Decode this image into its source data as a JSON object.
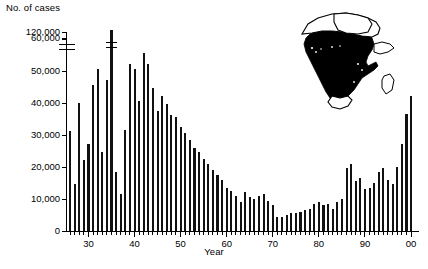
{
  "chart": {
    "ylabel": "No. of cases",
    "xlabel": "Year",
    "y_ticks": [
      "0",
      "10,000",
      "20,000",
      "30,000",
      "40,000",
      "50,000",
      "60,000",
      "120,000"
    ],
    "x_ticks": [
      "30",
      "40",
      "50",
      "60",
      "70",
      "80",
      "90",
      "00"
    ],
    "bar_color": "#111111",
    "axis_color": "#000000",
    "map_fill_color": "#000000",
    "map_outline_color": "#000000",
    "map_background_color": "#ffffff"
  },
  "inset": {
    "name": "africa-meningitis-belt-map",
    "description": "Map of Africa with endemic region shaded"
  },
  "chart_data": {
    "type": "bar",
    "title": "",
    "xlabel": "Year",
    "ylabel": "No. of cases",
    "ylim": [
      0,
      60000
    ],
    "y_axis_break": {
      "below": 60000,
      "above": 120000,
      "note": "scale break between 60,000 and 120,000"
    },
    "grid": false,
    "legend": null,
    "x_tick_labels": [
      "30",
      "40",
      "50",
      "60",
      "70",
      "80",
      "90",
      "00"
    ],
    "x_tick_years": [
      1930,
      1940,
      1950,
      1960,
      1970,
      1980,
      1990,
      2000
    ],
    "categories": [
      1926,
      1927,
      1928,
      1929,
      1930,
      1931,
      1932,
      1933,
      1934,
      1935,
      1936,
      1937,
      1938,
      1939,
      1940,
      1941,
      1942,
      1943,
      1944,
      1945,
      1946,
      1947,
      1948,
      1949,
      1950,
      1951,
      1952,
      1953,
      1954,
      1955,
      1956,
      1957,
      1958,
      1959,
      1960,
      1961,
      1962,
      1963,
      1964,
      1965,
      1966,
      1967,
      1968,
      1969,
      1970,
      1971,
      1972,
      1973,
      1974,
      1975,
      1976,
      1977,
      1978,
      1979,
      1980,
      1981,
      1982,
      1983,
      1984,
      1985,
      1986,
      1987,
      1988,
      1989,
      1990,
      1991,
      1992,
      1993,
      1994,
      1995,
      1996,
      1997,
      1998,
      1999,
      2000
    ],
    "values": [
      31000,
      14500,
      40000,
      22000,
      27000,
      45500,
      50500,
      24500,
      47000,
      120000,
      18500,
      11500,
      31500,
      52000,
      50500,
      40500,
      55500,
      52000,
      44500,
      37500,
      42000,
      39500,
      36000,
      35500,
      32500,
      30500,
      28500,
      26000,
      24500,
      22500,
      21000,
      19000,
      17500,
      16000,
      13500,
      12500,
      11000,
      9000,
      12000,
      10500,
      10000,
      11000,
      11500,
      9500,
      8000,
      4500,
      4500,
      5000,
      5500,
      5500,
      6000,
      6500,
      7000,
      8500,
      9000,
      8000,
      8500,
      7000,
      9000,
      10000,
      19500,
      21000,
      15500,
      16500,
      13000,
      13500,
      15000,
      18500,
      19500,
      16000,
      14500,
      20000,
      27000,
      36500,
      42000
    ],
    "values_note": "1935 bar exceeds the plotted scale and is drawn with a break mark",
    "series": [
      {
        "name": "No. of cases",
        "values": [
          31000,
          14500,
          40000,
          22000,
          27000,
          45500,
          50500,
          24500,
          47000,
          120000,
          18500,
          11500,
          31500,
          52000,
          50500,
          40500,
          55500,
          52000,
          44500,
          37500,
          42000,
          39500,
          36000,
          35500,
          32500,
          30500,
          28500,
          26000,
          24500,
          22500,
          21000,
          19000,
          17500,
          16000,
          13500,
          12500,
          11000,
          9000,
          12000,
          10500,
          10000,
          11000,
          11500,
          9500,
          8000,
          4500,
          4500,
          5000,
          5500,
          5500,
          6000,
          6500,
          7000,
          8500,
          9000,
          8000,
          8500,
          7000,
          9000,
          10000,
          19500,
          21000,
          15500,
          16500,
          13000,
          13500,
          15000,
          18500,
          19500,
          16000,
          14500,
          20000,
          27000,
          36500,
          42000
        ]
      }
    ]
  }
}
